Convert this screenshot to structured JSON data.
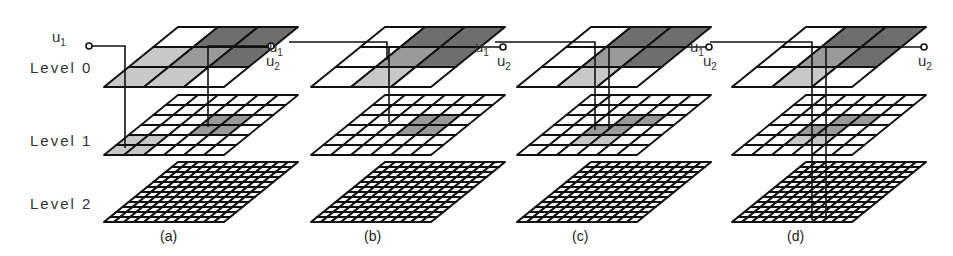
{
  "figure": {
    "level_labels": [
      "Level 0",
      "Level 1",
      "Level 2"
    ],
    "grid_sizes": [
      3,
      6,
      12
    ],
    "colors": {
      "line": "#111111",
      "white": "#ffffff",
      "light": "#c8c8c8",
      "mid": "#9a9a9a",
      "dark": "#6e6e6e"
    },
    "panels": [
      {
        "caption": "(a)",
        "u1": {
          "text": "u",
          "sub": "1"
        },
        "u2": {
          "text": "u",
          "sub": "2"
        },
        "level0_shading": [
          [
            "white",
            "dark",
            "dark"
          ],
          [
            "light",
            "mid",
            "dark"
          ],
          [
            "light",
            "light",
            "white"
          ]
        ],
        "level1_shaded": [
          [
            2,
            3,
            "mid"
          ],
          [
            2,
            4,
            "mid"
          ],
          [
            3,
            3,
            "mid"
          ],
          [
            3,
            4,
            "mid"
          ],
          [
            4,
            0,
            "light"
          ],
          [
            4,
            1,
            "light"
          ],
          [
            5,
            0,
            "light"
          ],
          [
            5,
            1,
            "light"
          ]
        ]
      },
      {
        "caption": "(b)",
        "u1": {
          "text": "u",
          "sub": "1"
        },
        "u2": {
          "text": "u",
          "sub": "2"
        },
        "level0_shading": [
          [
            "white",
            "dark",
            "dark"
          ],
          [
            "white",
            "mid",
            "dark"
          ],
          [
            "white",
            "light",
            "white"
          ]
        ],
        "level1_shaded": [
          [
            2,
            3,
            "mid"
          ],
          [
            2,
            4,
            "mid"
          ],
          [
            3,
            3,
            "mid"
          ],
          [
            3,
            4,
            "mid"
          ]
        ]
      },
      {
        "caption": "(c)",
        "u1": {
          "text": "u",
          "sub": "1"
        },
        "u2": {
          "text": "u",
          "sub": "2"
        },
        "level0_shading": [
          [
            "white",
            "dark",
            "dark"
          ],
          [
            "white",
            "mid",
            "dark"
          ],
          [
            "white",
            "light",
            "white"
          ]
        ],
        "level1_shaded": [
          [
            2,
            3,
            "mid"
          ],
          [
            2,
            4,
            "mid"
          ],
          [
            3,
            2,
            "mid"
          ],
          [
            3,
            3,
            "mid"
          ],
          [
            4,
            2,
            "light"
          ],
          [
            4,
            3,
            "light"
          ]
        ]
      },
      {
        "caption": "(d)",
        "u1": {
          "text": "u",
          "sub": "1"
        },
        "u2": {
          "text": "u",
          "sub": "2"
        },
        "level0_shading": [
          [
            "white",
            "dark",
            "dark"
          ],
          [
            "white",
            "mid",
            "dark"
          ],
          [
            "white",
            "light",
            "white"
          ]
        ],
        "level1_shaded": [
          [
            2,
            3,
            "mid"
          ],
          [
            2,
            4,
            "mid"
          ],
          [
            3,
            2,
            "mid"
          ],
          [
            3,
            3,
            "mid"
          ],
          [
            4,
            2,
            "light"
          ],
          [
            4,
            3,
            "light"
          ]
        ]
      }
    ]
  }
}
